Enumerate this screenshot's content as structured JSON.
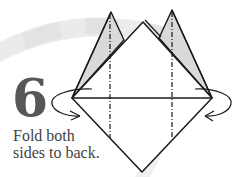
{
  "step": {
    "number": "6",
    "instruction_lines": [
      "Fold both",
      "sides to back."
    ]
  },
  "diagram": {
    "fold_type": "mountain-fold",
    "colors": {
      "outline": "#1a1a1a",
      "flap_fill": "#d9d9d9",
      "paper_fill": "#ffffff",
      "arc_band_light": "#ededed",
      "arc_band_dark": "#e3e3e3",
      "number": "#575757",
      "text": "#3f3f3f"
    }
  }
}
